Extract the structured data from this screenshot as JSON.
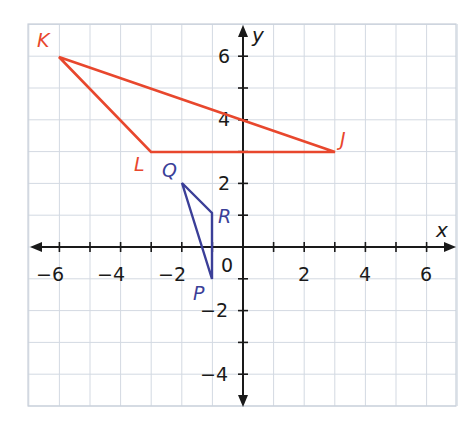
{
  "figure": {
    "type": "coordinate-plane",
    "axes": {
      "x_label": "x",
      "y_label": "y",
      "x_range": [
        -7,
        7
      ],
      "y_range": [
        -5,
        7
      ],
      "x_tick_labels": [
        {
          "value": -6,
          "label": "−6"
        },
        {
          "value": -4,
          "label": "−4"
        },
        {
          "value": -2,
          "label": "−2"
        },
        {
          "value": 2,
          "label": "2"
        },
        {
          "value": 4,
          "label": "4"
        },
        {
          "value": 6,
          "label": "6"
        }
      ],
      "y_tick_labels": [
        {
          "value": 6,
          "label": "6"
        },
        {
          "value": 4,
          "label": "4"
        },
        {
          "value": 2,
          "label": "2"
        },
        {
          "value": -2,
          "label": "−2"
        },
        {
          "value": -4,
          "label": "−4"
        }
      ],
      "origin_label": "0"
    },
    "colors": {
      "triangle_JKL": "#e8472d",
      "triangle_PQR": "#3b3f98",
      "grid": "#d3d9e2",
      "axis": "#1a1a1a"
    },
    "triangles": [
      {
        "name": "JKL",
        "color": "#e8472d",
        "vertices": [
          {
            "label": "J",
            "x": 3,
            "y": 3
          },
          {
            "label": "K",
            "x": -6,
            "y": 6
          },
          {
            "label": "L",
            "x": -3,
            "y": 3
          }
        ]
      },
      {
        "name": "PQR",
        "color": "#3b3f98",
        "vertices": [
          {
            "label": "P",
            "x": -1,
            "y": -1
          },
          {
            "label": "Q",
            "x": -2,
            "y": 2
          },
          {
            "label": "R",
            "x": -1,
            "y": 1
          }
        ]
      }
    ]
  },
  "labels": {
    "x_axis": "x",
    "y_axis": "y",
    "origin": "0",
    "J": "J",
    "K": "K",
    "L": "L",
    "P": "P",
    "Q": "Q",
    "R": "R",
    "xt_m6": "−6",
    "xt_m4": "−4",
    "xt_m2": "−2",
    "xt_2": "2",
    "xt_4": "4",
    "xt_6": "6",
    "yt_6": "6",
    "yt_4": "4",
    "yt_2": "2",
    "yt_m2": "−2",
    "yt_m4": "−4"
  }
}
